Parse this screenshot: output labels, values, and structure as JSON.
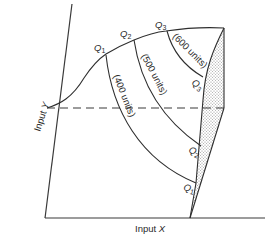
{
  "diagram": {
    "type": "isoquant-expansion-path",
    "axes": {
      "x_label_prefix": "Input ",
      "x_label_var": "X",
      "y_label_prefix": "Input ",
      "y_label_var": "Y"
    },
    "isoquants": [
      {
        "name": "Q",
        "sub": "1",
        "units_label": "(400 units)"
      },
      {
        "name": "Q",
        "sub": "2",
        "units_label": "(500 units)"
      },
      {
        "name": "Q",
        "sub": "3",
        "units_label": "(600 units)"
      }
    ],
    "colors": {
      "line": "#2e2e2e",
      "shading": "#bdbdbd",
      "background": "#ffffff"
    }
  }
}
